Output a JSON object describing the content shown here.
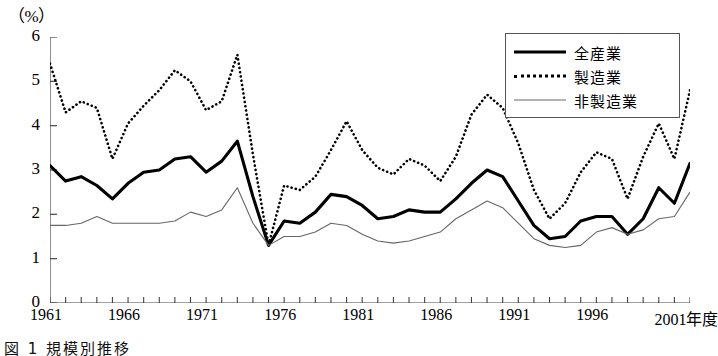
{
  "unit_label": "（%）",
  "caption": "図 1 規模別推移",
  "legend": {
    "items": [
      {
        "label": "全産業",
        "key": "solid-thick",
        "color": "#000000"
      },
      {
        "label": "製造業",
        "key": "dotted",
        "color": "#000000"
      },
      {
        "label": "非製造業",
        "key": "solid-thin",
        "color": "#666666"
      }
    ]
  },
  "axis": {
    "y_ticks": [
      "6",
      "5",
      "4",
      "3",
      "2",
      "1",
      "0"
    ],
    "x_tick_labels": [
      "1961",
      "1966",
      "1971",
      "1976",
      "1981",
      "1986",
      "1991",
      "1996",
      "2001年度"
    ],
    "x_tick_years": [
      1961,
      1966,
      1971,
      1976,
      1981,
      1986,
      1991,
      1996,
      2001
    ]
  },
  "chart_data": {
    "type": "line",
    "title": "",
    "xlabel": "年度",
    "ylabel": "（%）",
    "ylim": [
      0,
      6
    ],
    "xlim": [
      1961,
      2002
    ],
    "grid": false,
    "legend_position": "top-right",
    "x": [
      1961,
      1962,
      1963,
      1964,
      1965,
      1966,
      1967,
      1968,
      1969,
      1970,
      1971,
      1972,
      1973,
      1974,
      1975,
      1976,
      1977,
      1978,
      1979,
      1980,
      1981,
      1982,
      1983,
      1984,
      1985,
      1986,
      1987,
      1988,
      1989,
      1990,
      1991,
      1992,
      1993,
      1994,
      1995,
      1996,
      1997,
      1998,
      1999,
      2000,
      2001,
      2002
    ],
    "series": [
      {
        "name": "全産業",
        "style": "solid-thick",
        "color": "#000000",
        "values": [
          3.1,
          2.75,
          2.85,
          2.65,
          2.35,
          2.7,
          2.95,
          3.0,
          3.25,
          3.3,
          2.95,
          3.2,
          3.65,
          2.4,
          1.3,
          1.85,
          1.8,
          2.05,
          2.45,
          2.4,
          2.2,
          1.9,
          1.95,
          2.1,
          2.05,
          2.05,
          2.35,
          2.7,
          3.0,
          2.85,
          2.3,
          1.75,
          1.45,
          1.5,
          1.85,
          1.95,
          1.95,
          1.55,
          1.9,
          2.6,
          2.25,
          3.15
        ]
      },
      {
        "name": "製造業",
        "style": "dotted",
        "color": "#000000",
        "values": [
          5.4,
          4.3,
          4.55,
          4.4,
          3.25,
          4.05,
          4.45,
          4.8,
          5.25,
          5.0,
          4.35,
          4.55,
          5.6,
          3.35,
          1.3,
          2.65,
          2.55,
          2.85,
          3.45,
          4.1,
          3.45,
          3.05,
          2.9,
          3.25,
          3.1,
          2.75,
          3.3,
          4.25,
          4.7,
          4.4,
          3.6,
          2.55,
          1.9,
          2.25,
          2.95,
          3.4,
          3.25,
          2.35,
          3.3,
          4.05,
          3.25,
          4.8
        ]
      },
      {
        "name": "非製造業",
        "style": "solid-thin",
        "color": "#666666",
        "values": [
          1.75,
          1.75,
          1.8,
          1.95,
          1.8,
          1.8,
          1.8,
          1.8,
          1.85,
          2.05,
          1.95,
          2.1,
          2.6,
          1.8,
          1.3,
          1.5,
          1.5,
          1.6,
          1.8,
          1.75,
          1.55,
          1.4,
          1.35,
          1.4,
          1.5,
          1.6,
          1.9,
          2.1,
          2.3,
          2.15,
          1.8,
          1.45,
          1.3,
          1.25,
          1.3,
          1.6,
          1.7,
          1.55,
          1.65,
          1.9,
          1.95,
          2.5
        ]
      }
    ]
  }
}
